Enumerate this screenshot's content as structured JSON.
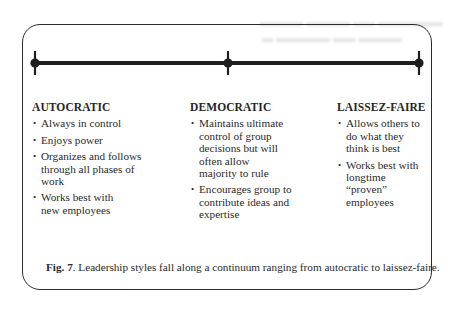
{
  "figure": {
    "continuum": {
      "markers": [
        {
          "position": "left",
          "x": 35
        },
        {
          "position": "center",
          "x": 228
        },
        {
          "position": "right",
          "x": 419
        }
      ],
      "line_color": "#1e1e1e"
    },
    "columns": [
      {
        "heading": "AUTOCRATIC",
        "items": [
          "Always in control",
          "Enjoys power",
          "Organizes and follows through all phases of work",
          "Works best with new employees"
        ]
      },
      {
        "heading": "DEMOCRATIC",
        "items": [
          "Maintains ultimate control of group decisions but will often allow majority to rule",
          "Encourages group to contribute ideas and expertise"
        ]
      },
      {
        "heading": "LAISSEZ-FAIRE",
        "items": [
          "Allows others to do what they think is best",
          "Works best with longtime “proven” employees"
        ]
      }
    ],
    "bullet_glyph": "•",
    "caption": {
      "label": "Fig. 7",
      "text": ". Leadership styles fall along a continuum ranging from autocratic to laissez-faire."
    }
  }
}
